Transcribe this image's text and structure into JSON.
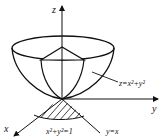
{
  "diagram": {
    "type": "3d-surface-region",
    "axes": {
      "z_label": "z",
      "y_label": "y",
      "x_label": "x"
    },
    "surface_label": "z=x²+y²",
    "region_boundary_label": "x²+y²=1",
    "line_label": "y=x",
    "colors": {
      "stroke": "#111111",
      "background": "#ffffff"
    }
  }
}
